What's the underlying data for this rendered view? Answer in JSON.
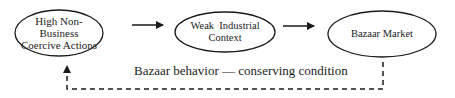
{
  "diagram": {
    "nodes": [
      {
        "id": "n1",
        "label_lines": [
          "High Non-",
          "Business",
          "Coercive Actions"
        ]
      },
      {
        "id": "n2",
        "label_lines": [
          "Weak  Industrial",
          "Context"
        ]
      },
      {
        "id": "n3",
        "label_lines": [
          "Bazaar Market"
        ]
      }
    ],
    "edges": [
      {
        "from": "n1",
        "to": "n2",
        "style": "solid"
      },
      {
        "from": "n2",
        "to": "n3",
        "style": "solid"
      },
      {
        "from": "n3",
        "to": "n1",
        "style": "dashed",
        "label": "Bazaar behavior — conserving condition"
      }
    ],
    "feedback_label": "Bazaar behavior — conserving condition",
    "colors": {
      "stroke": "#1a1a1a",
      "text": "#222222",
      "background": "#ffffff"
    }
  }
}
